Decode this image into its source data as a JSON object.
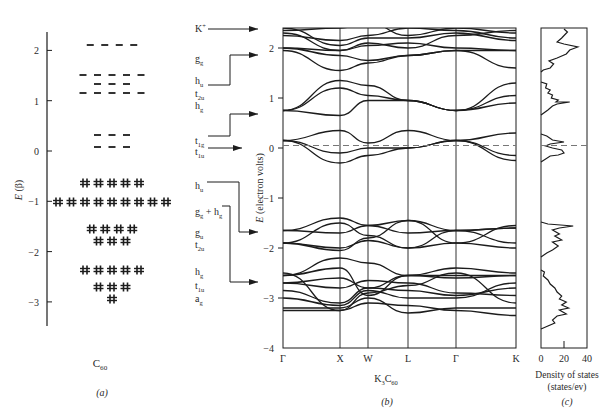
{
  "figure": {
    "panel_a": {
      "caption": "(a)",
      "molecule_label": "C",
      "molecule_sub": "60",
      "ylabel": "E (β)",
      "yticks": [
        2,
        1,
        0,
        -1,
        -2,
        -3
      ],
      "levels": [
        {
          "name": "gg",
          "energy": 2.1,
          "count": 4,
          "filled": false
        },
        {
          "name": "hu",
          "energy": 1.5,
          "count": 5,
          "filled": false
        },
        {
          "name": "t2u",
          "energy": 1.35,
          "count": 3,
          "filled": false
        },
        {
          "name": "hg",
          "energy": 1.15,
          "count": 5,
          "filled": false
        },
        {
          "name": "t1g",
          "energy": 0.3,
          "count": 3,
          "filled": false
        },
        {
          "name": "t1u",
          "energy": 0.05,
          "count": 3,
          "filled": false
        },
        {
          "name": "hu",
          "energy": -0.65,
          "count": 5,
          "filled": true
        },
        {
          "name": "gg + hg",
          "energy": -1.0,
          "count": 9,
          "filled": true
        },
        {
          "name": "gu",
          "energy": -1.55,
          "count": 4,
          "filled": true
        },
        {
          "name": "t2u",
          "energy": -1.8,
          "count": 3,
          "filled": true
        },
        {
          "name": "hg",
          "energy": -2.4,
          "count": 5,
          "filled": true
        },
        {
          "name": "t1u",
          "energy": -2.7,
          "count": 3,
          "filled": true
        },
        {
          "name": "ag",
          "energy": -2.95,
          "count": 1,
          "filled": true
        }
      ]
    },
    "labels_column": [
      {
        "base": "K",
        "sup": "+",
        "sub": ""
      },
      {
        "base": "g",
        "sup": "",
        "sub": "g"
      },
      {
        "base": "h",
        "sup": "",
        "sub": "u"
      },
      {
        "base": "t",
        "sup": "",
        "sub": "2u"
      },
      {
        "base": "h",
        "sup": "",
        "sub": "g"
      },
      {
        "base": "t",
        "sup": "",
        "sub": "1g"
      },
      {
        "base": "t",
        "sup": "",
        "sub": "1u"
      },
      {
        "base": "h",
        "sup": "",
        "sub": "u"
      },
      {
        "base": "g",
        "sup": "",
        "sub": "g",
        "extra": " + h",
        "extra_sub": "g"
      },
      {
        "base": "g",
        "sup": "",
        "sub": "u"
      },
      {
        "base": "t",
        "sup": "",
        "sub": "2u"
      },
      {
        "base": "h",
        "sup": "",
        "sub": "g"
      },
      {
        "base": "t",
        "sup": "",
        "sub": "1u"
      },
      {
        "base": "a",
        "sup": "",
        "sub": "g"
      }
    ],
    "panel_b": {
      "caption": "(b)",
      "material_label": "K",
      "material_sub1": "3",
      "material_mid": "C",
      "material_sub2": "60",
      "ylabel": "E (electron volts)",
      "yticks": [
        2,
        1,
        0,
        -1,
        -2,
        -3,
        -4
      ],
      "ylim": [
        -4,
        2.4
      ],
      "kpoints": [
        "Γ",
        "X",
        "W",
        "L",
        "Γ",
        "K"
      ],
      "fermi_level": 0.05
    },
    "panel_c": {
      "caption": "(c)",
      "xlabel_line1": "Density of states",
      "xlabel_line2": "(states/ev)",
      "xticks": [
        "0",
        "20",
        "40"
      ]
    }
  },
  "chart_data": [
    {
      "type": "scatter",
      "title": "C60 molecular orbital energy levels (Hückel)",
      "panel": "(a)",
      "xlabel": "",
      "ylabel": "E (β)",
      "ylim": [
        -3.5,
        2.4
      ],
      "categories": [
        "gg",
        "hu",
        "t2u",
        "hg",
        "t1g",
        "t1u",
        "hu",
        "gg + hg",
        "gu",
        "t2u",
        "hg",
        "t1u",
        "ag"
      ],
      "values": [
        2.1,
        1.5,
        1.35,
        1.15,
        0.3,
        0.05,
        -0.65,
        -1.0,
        -1.55,
        -1.8,
        -2.4,
        -2.7,
        -2.95
      ],
      "degeneracy": [
        4,
        5,
        3,
        5,
        3,
        3,
        5,
        9,
        4,
        3,
        5,
        3,
        1
      ],
      "occupied": [
        false,
        false,
        false,
        false,
        false,
        false,
        true,
        true,
        true,
        true,
        true,
        true,
        true
      ]
    },
    {
      "type": "line",
      "title": "K3C60 band structure",
      "panel": "(b)",
      "xlabel": "K3C60",
      "ylabel": "E (electron volts)",
      "x": [
        "Γ",
        "X",
        "W",
        "L",
        "Γ",
        "K"
      ],
      "ylim": [
        -4,
        2.4
      ],
      "annotations": [
        "Fermi level dashed line at ~0.05 eV",
        "Band groups: t1u (~-0.3 to 0.4), t1g (~0.6 to 1.35), hg/t2u/hu/gg (~1.5 to 2.4), hu (~-2.1 to -1.4), gg+hg (~-3.3 to -2.2)"
      ],
      "series": [
        {
          "name": "t1u band group",
          "values_range": [
            -0.3,
            0.4
          ]
        },
        {
          "name": "t1g band group",
          "values_range": [
            0.6,
            1.35
          ]
        },
        {
          "name": "upper band group",
          "values_range": [
            1.55,
            2.4
          ]
        },
        {
          "name": "hu band group",
          "values_range": [
            -2.05,
            -1.4
          ]
        },
        {
          "name": "gg+hg band group",
          "values_range": [
            -3.3,
            -2.2
          ]
        }
      ],
      "grid": false
    },
    {
      "type": "line",
      "title": "Density of states",
      "panel": "(c)",
      "xlabel": "Density of states (states/ev)",
      "ylabel": "",
      "xlim": [
        0,
        40
      ],
      "xticks": [
        0,
        20,
        40
      ],
      "peaks": [
        {
          "energy": 2.0,
          "dos": 35
        },
        {
          "energy": 0.9,
          "dos": 25
        },
        {
          "energy": 0.2,
          "dos": 20
        },
        {
          "energy": -1.6,
          "dos": 30
        },
        {
          "energy": -2.9,
          "dos": 26
        }
      ]
    }
  ]
}
